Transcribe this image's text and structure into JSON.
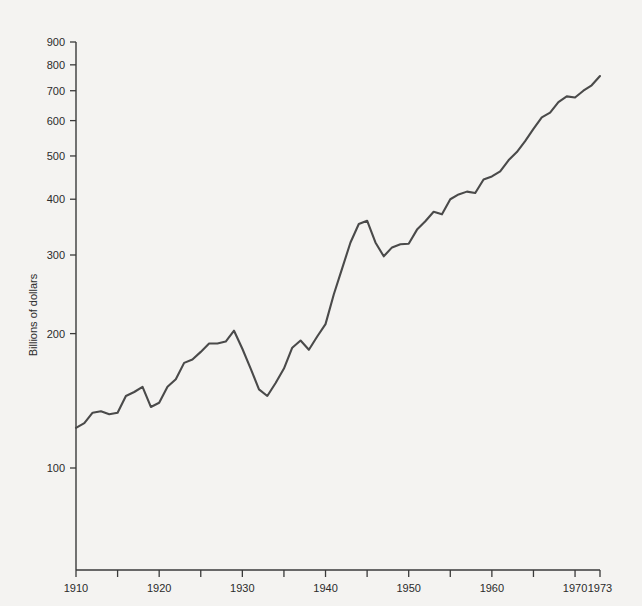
{
  "chart_data": {
    "type": "line",
    "title": "",
    "subtitle": "",
    "xlabel": "",
    "ylabel": "Billions of dollars",
    "yscale": "log",
    "ylim": [
      60,
      900
    ],
    "xlim": [
      1910,
      1973
    ],
    "grid": false,
    "legend": null,
    "y_ticks": [
      100,
      200,
      300,
      400,
      500,
      600,
      700,
      800,
      900
    ],
    "y_tick_labels": [
      "100",
      "200",
      "300",
      "400",
      "500",
      "600",
      "700",
      "800",
      "900"
    ],
    "x_ticks": [
      1910,
      1915,
      1920,
      1925,
      1930,
      1935,
      1940,
      1945,
      1950,
      1955,
      1960,
      1965,
      1970,
      1973
    ],
    "x_tick_labels": [
      "1910",
      "",
      "1920",
      "",
      "1930",
      "",
      "1940",
      "",
      "1950",
      "",
      "1960",
      "",
      "1970",
      "1973"
    ],
    "line_color": "#4a4a4a",
    "background_color": "#f4f3f1",
    "axis_color": "#3a3a3a",
    "series": [
      {
        "name": "Gross national product",
        "x": [
          1910,
          1911,
          1912,
          1913,
          1914,
          1915,
          1916,
          1917,
          1918,
          1919,
          1920,
          1921,
          1922,
          1923,
          1924,
          1925,
          1926,
          1927,
          1928,
          1929,
          1930,
          1931,
          1932,
          1933,
          1934,
          1935,
          1936,
          1937,
          1938,
          1939,
          1940,
          1941,
          1942,
          1943,
          1944,
          1945,
          1946,
          1947,
          1948,
          1949,
          1950,
          1951,
          1952,
          1953,
          1954,
          1955,
          1956,
          1957,
          1958,
          1959,
          1960,
          1961,
          1962,
          1963,
          1964,
          1965,
          1966,
          1967,
          1968,
          1969,
          1970,
          1971,
          1972,
          1973
        ],
        "values": [
          123,
          126,
          133,
          134,
          132,
          133,
          145,
          148,
          152,
          137,
          140,
          152,
          158,
          172,
          175,
          182,
          190,
          190,
          192,
          203,
          185,
          167,
          150,
          145,
          155,
          167,
          186,
          193,
          184,
          197,
          210,
          245,
          280,
          320,
          352,
          358,
          320,
          298,
          312,
          317,
          318,
          342,
          357,
          375,
          370,
          400,
          410,
          416,
          413,
          443,
          450,
          462,
          489,
          510,
          540,
          575,
          610,
          625,
          660,
          680,
          676,
          700,
          720,
          755
        ],
        "unit": "billions of dollars"
      }
    ]
  },
  "axis_titles": {
    "y": "Billions of dollars"
  }
}
